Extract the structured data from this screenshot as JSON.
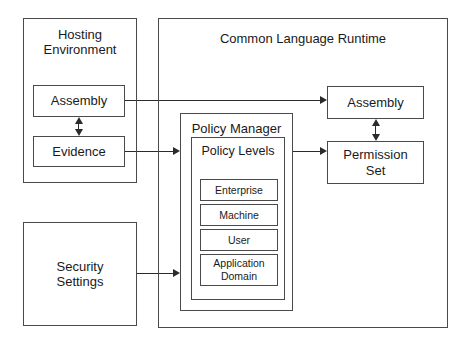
{
  "diagram": {
    "containers": {
      "hosting_environment": "Hosting\nEnvironment",
      "hosting_environment_line1": "Hosting",
      "hosting_environment_line2": "Environment",
      "common_language_runtime": "Common Language Runtime",
      "security_settings_line1": "Security",
      "security_settings_line2": "Settings",
      "policy_manager": "Policy Manager",
      "policy_levels": "Policy Levels"
    },
    "nodes": {
      "assembly_left": "Assembly",
      "evidence": "Evidence",
      "assembly_right": "Assembly",
      "permission_set_line1": "Permission",
      "permission_set_line2": "Set"
    },
    "policy_levels": [
      {
        "label": "Enterprise"
      },
      {
        "label": "Machine"
      },
      {
        "label": "User"
      },
      {
        "label": "Application\nDomain",
        "line1": "Application",
        "line2": "Domain"
      }
    ],
    "connections": [
      {
        "from": "Assembly (Hosting Environment)",
        "to": "Assembly (CLR)",
        "style": "single-arrow"
      },
      {
        "from": "Assembly (Hosting Environment)",
        "to": "Evidence",
        "style": "double-arrow-vertical"
      },
      {
        "from": "Evidence",
        "to": "Policy Manager",
        "style": "single-arrow"
      },
      {
        "from": "Security Settings",
        "to": "Policy Manager",
        "style": "single-arrow"
      },
      {
        "from": "Policy Manager",
        "to": "Permission Set",
        "style": "single-arrow"
      },
      {
        "from": "Assembly (CLR)",
        "to": "Permission Set",
        "style": "double-arrow-vertical"
      }
    ],
    "colors": {
      "stroke": "#4a4a4a",
      "connector": "#2b2b2b",
      "text": "#1a1a1a",
      "background": "#ffffff"
    }
  }
}
